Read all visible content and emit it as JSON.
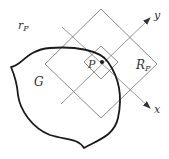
{
  "labels": {
    "r_main": "r",
    "r_sub": "P",
    "region": "G",
    "point": "P",
    "R_main": "R",
    "R_sub": "P",
    "x_axis": "x",
    "y_axis": "y"
  },
  "colors": {
    "background": "#ffffff",
    "thin_line": "#6b6b6b",
    "thick_curve": "#1a1a1a",
    "text": "#333333"
  }
}
